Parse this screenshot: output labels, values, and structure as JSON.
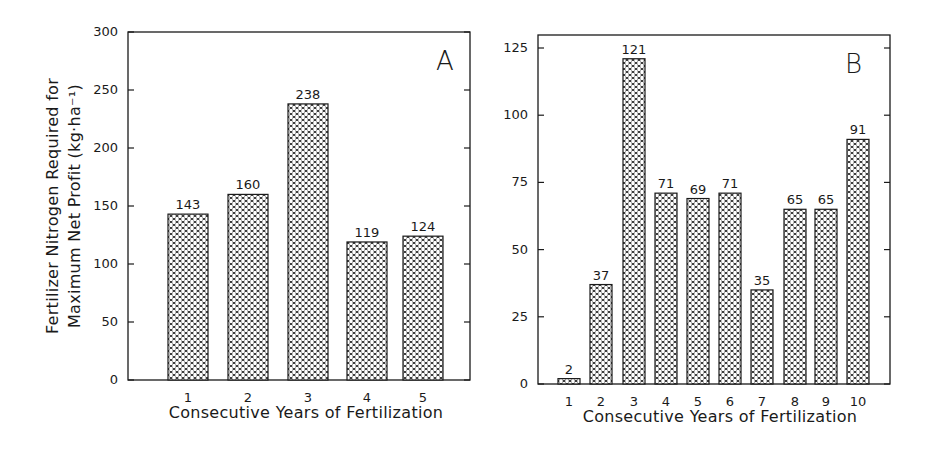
{
  "chart_data": [
    {
      "panel": "A",
      "type": "bar",
      "title": "",
      "panel_label": "A",
      "xlabel": "Consecutive Years of Fertilization",
      "ylabel_line1": "Fertilizer Nitrogen Required for",
      "ylabel_line2": "Maximum Net Profit (kg·ha⁻¹)",
      "categories": [
        "1",
        "2",
        "3",
        "4",
        "5"
      ],
      "values": [
        143,
        160,
        238,
        119,
        124
      ],
      "bar_labels": [
        "143",
        "160",
        "238",
        "119",
        "124"
      ],
      "ylim": [
        0,
        300
      ],
      "yticks": [
        0,
        50,
        100,
        150,
        200,
        250,
        300
      ],
      "grid": false,
      "pattern": "crosshatch"
    },
    {
      "panel": "B",
      "type": "bar",
      "title": "",
      "panel_label": "B",
      "xlabel": "Consecutive Years of Fertilization",
      "ylabel": "",
      "categories": [
        "1",
        "2",
        "3",
        "4",
        "5",
        "6",
        "7",
        "8",
        "9",
        "10"
      ],
      "values": [
        2,
        37,
        121,
        71,
        69,
        71,
        35,
        65,
        65,
        91
      ],
      "bar_labels": [
        "2",
        "37",
        "121",
        "71",
        "69",
        "71",
        "35",
        "65",
        "65",
        "91"
      ],
      "ylim": [
        0,
        130
      ],
      "yticks": [
        0,
        25,
        50,
        75,
        100,
        125
      ],
      "grid": false,
      "pattern": "crosshatch"
    }
  ],
  "colors": {
    "ink": "#1a1a1a",
    "background": "#ffffff"
  }
}
